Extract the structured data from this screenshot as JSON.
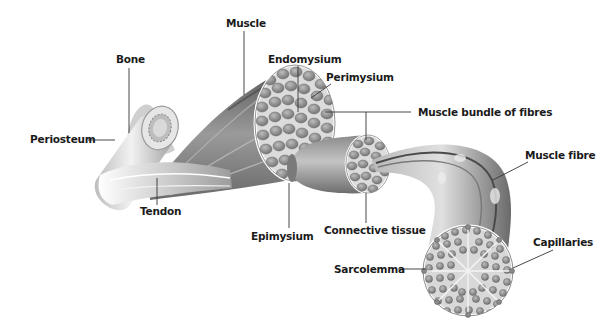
{
  "diagram": {
    "colors": {
      "background": "#ffffff",
      "label_text": "#1a1a1a",
      "leader_line": "#333333",
      "tissue_dark": "#6e6e6e",
      "tissue_mid": "#9a9a9a",
      "tissue_light": "#d6d6d6",
      "fibre_cell": "#8c8c8c"
    },
    "labels": {
      "muscle": "Muscle",
      "bone": "Bone",
      "endomysium": "Endomysium",
      "perimysium": "Perimysium",
      "muscle_bundle": "Muscle bundle of fibres",
      "periosteum": "Periosteum",
      "muscle_fibre": "Muscle fibre",
      "tendon": "Tendon",
      "epimysium": "Epimysium",
      "connective_tissue": "Connective tissue",
      "capillaries": "Capillaries",
      "sarcolemma": "Sarcolemma"
    }
  }
}
